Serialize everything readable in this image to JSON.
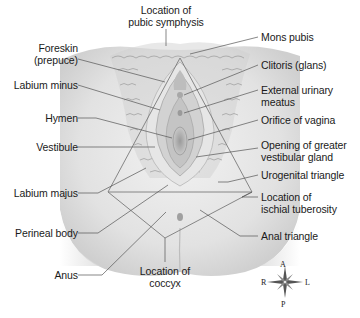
{
  "diagram": {
    "type": "anatomical-illustration",
    "labels_left": [
      {
        "id": "foreskin",
        "text": "Foreskin",
        "text2": "(prepuce)"
      },
      {
        "id": "labium-minus",
        "text": "Labium minus"
      },
      {
        "id": "hymen",
        "text": "Hymen"
      },
      {
        "id": "vestibule",
        "text": "Vestibule"
      },
      {
        "id": "labium-majus",
        "text": "Labium majus"
      },
      {
        "id": "perineal-body",
        "text": "Perineal body"
      },
      {
        "id": "anus",
        "text": "Anus"
      }
    ],
    "labels_right": [
      {
        "id": "mons-pubis",
        "text": "Mons pubis"
      },
      {
        "id": "clitoris",
        "text": "Clitoris (glans)"
      },
      {
        "id": "external-urinary-meatus",
        "text": "External urinary",
        "text2": "meatus"
      },
      {
        "id": "orifice-of-vagina",
        "text": "Orifice of vagina"
      },
      {
        "id": "opening-greater-vestibular-gland",
        "text": "Opening of greater",
        "text2": "vestibular gland"
      },
      {
        "id": "urogenital-triangle",
        "text": "Urogenital triangle"
      },
      {
        "id": "ischial-tuberosity",
        "text": "Location of",
        "text2": "ischial tuberosity"
      },
      {
        "id": "anal-triangle",
        "text": "Anal triangle"
      }
    ],
    "labels_center": [
      {
        "id": "pubic-symphysis",
        "text": "Location of",
        "text2": "pubic symphysis"
      },
      {
        "id": "coccyx",
        "text": "Location of",
        "text2": "coccyx"
      }
    ],
    "compass": {
      "top": "A",
      "bottom": "P",
      "left": "R",
      "right": "L"
    }
  }
}
